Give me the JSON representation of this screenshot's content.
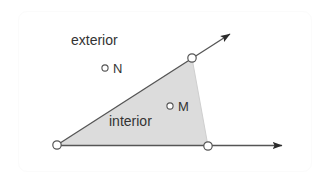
{
  "figure": {
    "background_color": "#ffffff",
    "card": {
      "border_color": "#fbfbfb",
      "fill_color": "#ffffff"
    },
    "region_fill_color": "#dcdcdc",
    "line_color": "#555555",
    "text_color": "#333333",
    "marker": {
      "fill_color": "#ffffff",
      "stroke_color": "#555555"
    },
    "labels": {
      "exterior": "exterior",
      "interior": "interior",
      "point_n": "N",
      "point_m": "M"
    },
    "points": {
      "vertex": {
        "x": 57,
        "y": 145
      },
      "upper_ray_point": {
        "x": 192,
        "y": 58
      },
      "lower_ray_point": {
        "x": 208,
        "y": 146
      },
      "point_n": {
        "x": 105,
        "y": 68
      },
      "point_m": {
        "x": 170,
        "y": 106
      }
    },
    "rays": {
      "upper_arrow_tip": {
        "x": 236,
        "y": 30
      },
      "lower_arrow_tip": {
        "x": 288,
        "y": 146
      }
    }
  }
}
